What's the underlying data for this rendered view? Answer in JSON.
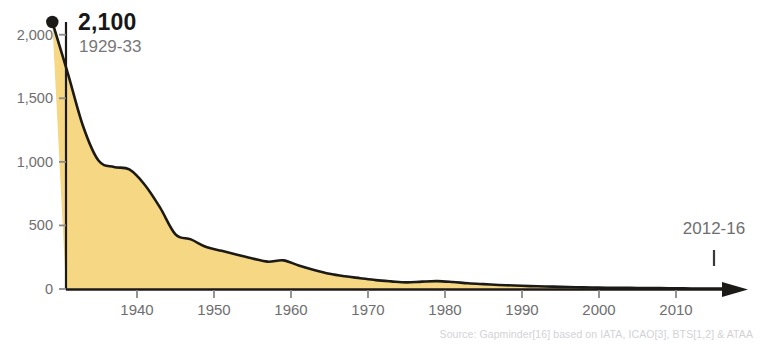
{
  "top_cropped_text": "",
  "callout": {
    "value": "2,100",
    "period": "1929-33"
  },
  "end_annotation": {
    "label": "2012-16"
  },
  "source": {
    "text": "Source: Gapminder[16] based on IATA, ICAO[3], BTS[1,2] & ATAA"
  },
  "colors": {
    "area_fill": "#f6d784",
    "line": "#1b1a17",
    "axis": "#1b1a17",
    "tick_label": "#6e6e70",
    "callout_value": "#17171a",
    "callout_years": "#77777a",
    "source_text": "#d2d2d6"
  },
  "chart_data": {
    "type": "area",
    "title": "",
    "subtitle": "",
    "xlabel": "",
    "ylabel": "",
    "xlim": [
      1929,
      2016
    ],
    "ylim": [
      0,
      2100
    ],
    "grid": false,
    "legend": false,
    "y_ticks": [
      0,
      500,
      1000,
      1500,
      2000
    ],
    "y_tick_labels": [
      "0",
      "500",
      "1,000",
      "1,500",
      "2,000"
    ],
    "x_ticks": [
      1940,
      1950,
      1960,
      1970,
      1980,
      1990,
      2000,
      2010
    ],
    "x_tick_labels": [
      "1940",
      "1950",
      "1960",
      "1970",
      "1980",
      "1990",
      "2000",
      "2010"
    ],
    "annotations": [
      {
        "x": 1929,
        "y": 2100,
        "label": "2,100",
        "sublabel": "1929-33",
        "marker": "dot"
      },
      {
        "x": 2012,
        "y": 0,
        "label": "2012-16",
        "marker": "tick"
      }
    ],
    "series": [
      {
        "name": "Fatalities per 10 billion passenger-km",
        "x": [
          1929,
          1931,
          1933,
          1935,
          1937,
          1939,
          1941,
          1943,
          1945,
          1947,
          1949,
          1951,
          1953,
          1955,
          1957,
          1959,
          1961,
          1963,
          1965,
          1967,
          1969,
          1971,
          1973,
          1975,
          1977,
          1979,
          1981,
          1983,
          1985,
          1987,
          1989,
          1991,
          1993,
          1995,
          1997,
          1999,
          2001,
          2003,
          2005,
          2007,
          2009,
          2011,
          2013,
          2015,
          2016
        ],
        "y": [
          2100,
          1700,
          1280,
          1010,
          960,
          940,
          820,
          640,
          430,
          390,
          330,
          300,
          270,
          240,
          215,
          225,
          185,
          150,
          120,
          100,
          85,
          70,
          60,
          52,
          58,
          62,
          55,
          45,
          38,
          32,
          27,
          23,
          20,
          17,
          14,
          12,
          10,
          9,
          8,
          7,
          6,
          5,
          4,
          3,
          3
        ]
      }
    ]
  }
}
